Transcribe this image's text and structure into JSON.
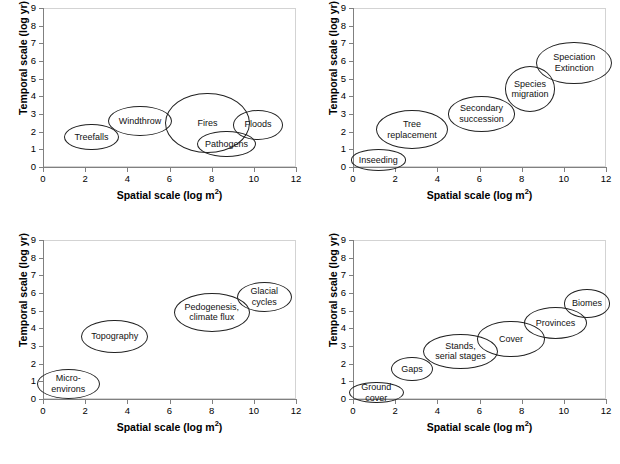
{
  "figure": {
    "axis_x_title": "Spatial scale (log m2)",
    "axis_y_title": "Temporal scale (log yr)",
    "x_ticks": [
      "0",
      "2",
      "4",
      "6",
      "8",
      "10",
      "12"
    ],
    "y_ticks": [
      "0",
      "1",
      "2",
      "3",
      "4",
      "5",
      "6",
      "7",
      "8",
      "9"
    ],
    "stroke_color": "#222222",
    "frame_color": "#d3d3d3",
    "axis_color": "#808080"
  },
  "chart_data": [
    {
      "type": "scatter",
      "panel": "top-left",
      "title": "",
      "xlabel": "Spatial scale (log m2)",
      "ylabel": "Temporal scale (log yr)",
      "xlim": [
        0,
        12
      ],
      "ylim": [
        0,
        9
      ],
      "grid": false,
      "legend": "none",
      "items": [
        {
          "label": "Treefalls",
          "x": 2.3,
          "y": 1.7,
          "rx": 1.3,
          "ry": 0.75
        },
        {
          "label": "Windthrow",
          "x": 4.6,
          "y": 2.6,
          "rx": 1.5,
          "ry": 0.85
        },
        {
          "label": "Fires",
          "x": 7.8,
          "y": 2.5,
          "rx": 2.0,
          "ry": 1.7
        },
        {
          "label": "Pathogens",
          "x": 8.7,
          "y": 1.3,
          "rx": 1.4,
          "ry": 0.75
        },
        {
          "label": "Floods",
          "x": 10.2,
          "y": 2.4,
          "rx": 1.2,
          "ry": 0.85
        }
      ]
    },
    {
      "type": "scatter",
      "panel": "top-right",
      "title": "",
      "xlabel": "Spatial scale (log m2)",
      "ylabel": "Temporal scale (log yr)",
      "xlim": [
        0,
        12
      ],
      "ylim": [
        0,
        9
      ],
      "grid": false,
      "legend": "none",
      "items": [
        {
          "label": "Inseeding",
          "x": 1.2,
          "y": 0.4,
          "rx": 1.3,
          "ry": 0.6
        },
        {
          "label": "Tree\nreplacement",
          "x": 2.8,
          "y": 2.1,
          "rx": 1.7,
          "ry": 1.1
        },
        {
          "label": "Secondary\nsuccession",
          "x": 6.1,
          "y": 3.0,
          "rx": 1.6,
          "ry": 1.0
        },
        {
          "label": "Species\nmigration",
          "x": 8.4,
          "y": 4.4,
          "rx": 1.2,
          "ry": 1.3
        },
        {
          "label": "Speciation\nExtinction",
          "x": 10.5,
          "y": 5.9,
          "rx": 1.8,
          "ry": 1.2
        }
      ]
    },
    {
      "type": "scatter",
      "panel": "bottom-left",
      "title": "",
      "xlabel": "Spatial scale (log m2)",
      "ylabel": "Temporal scale (log yr)",
      "xlim": [
        0,
        12
      ],
      "ylim": [
        0,
        9
      ],
      "grid": false,
      "legend": "none",
      "items": [
        {
          "label": "Micro-\nenvirons",
          "x": 1.2,
          "y": 0.85,
          "rx": 1.5,
          "ry": 0.85
        },
        {
          "label": "Topography",
          "x": 3.4,
          "y": 3.55,
          "rx": 1.6,
          "ry": 0.95
        },
        {
          "label": "Pedogenesis,\nclimate flux",
          "x": 8.0,
          "y": 4.9,
          "rx": 1.8,
          "ry": 1.1
        },
        {
          "label": "Glacial\ncycles",
          "x": 10.5,
          "y": 5.8,
          "rx": 1.3,
          "ry": 0.85
        }
      ]
    },
    {
      "type": "scatter",
      "panel": "bottom-right",
      "title": "",
      "xlabel": "Spatial scale (log m2)",
      "ylabel": "Temporal scale (log yr)",
      "xlim": [
        0,
        12
      ],
      "ylim": [
        0,
        9
      ],
      "grid": false,
      "legend": "none",
      "items": [
        {
          "label": "Ground cover",
          "x": 1.1,
          "y": 0.35,
          "rx": 1.3,
          "ry": 0.6
        },
        {
          "label": "Gaps",
          "x": 2.8,
          "y": 1.7,
          "rx": 1.0,
          "ry": 0.7
        },
        {
          "label": "Stands,\nserial stages",
          "x": 5.1,
          "y": 2.7,
          "rx": 1.8,
          "ry": 1.0
        },
        {
          "label": "Cover",
          "x": 7.5,
          "y": 3.4,
          "rx": 1.6,
          "ry": 1.0
        },
        {
          "label": "Provinces",
          "x": 9.6,
          "y": 4.3,
          "rx": 1.5,
          "ry": 0.9
        },
        {
          "label": "Biomes",
          "x": 11.1,
          "y": 5.4,
          "rx": 1.1,
          "ry": 0.8
        }
      ]
    }
  ]
}
